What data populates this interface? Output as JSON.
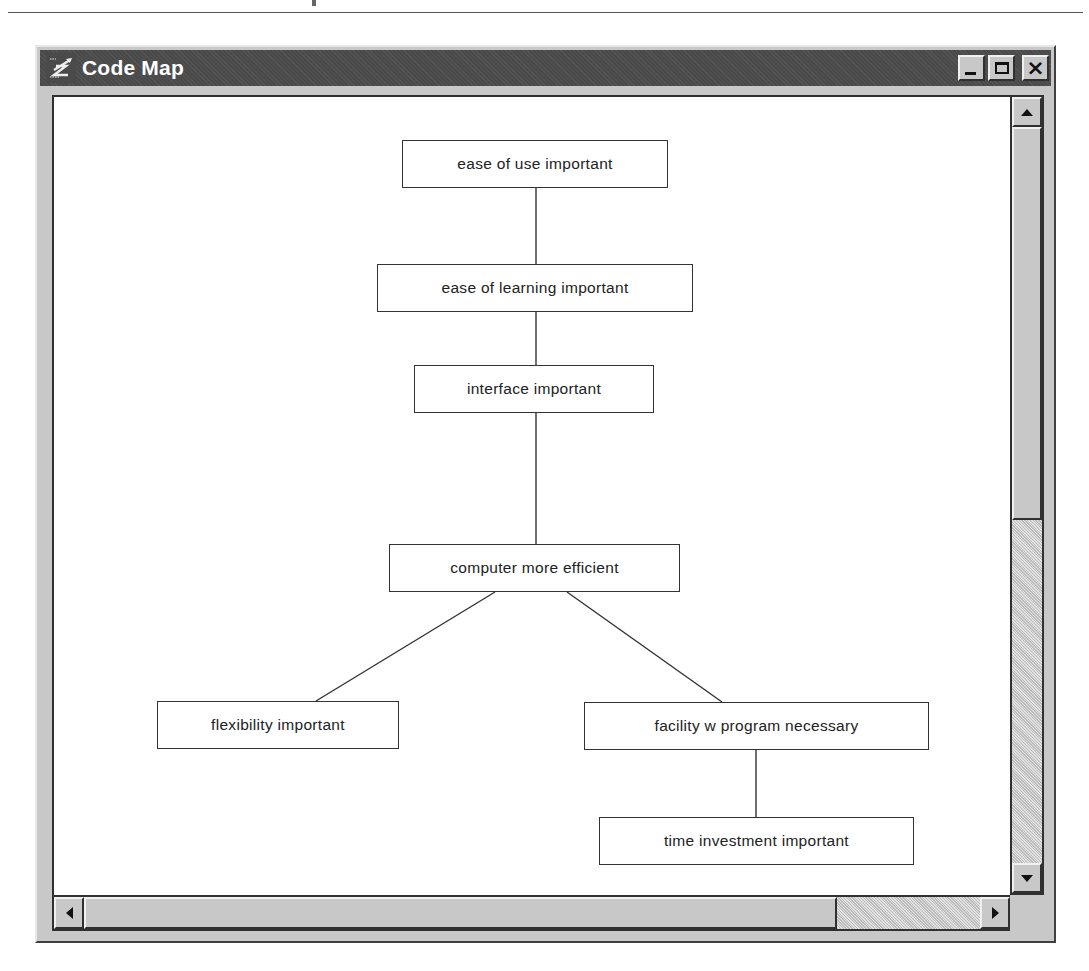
{
  "window": {
    "title": "Code Map",
    "icon": "code-map-app-icon",
    "controls": {
      "minimize": "minimize-icon",
      "maximize": "maximize-icon",
      "close": "close-icon",
      "close_glyph": "×"
    }
  },
  "map": {
    "nodes": [
      {
        "id": "n1",
        "label": "ease of use important",
        "x": 348,
        "y": 43,
        "w": 266,
        "h": 48
      },
      {
        "id": "n2",
        "label": "ease of learning important",
        "x": 323,
        "y": 167,
        "w": 316,
        "h": 48
      },
      {
        "id": "n3",
        "label": "interface important",
        "x": 360,
        "y": 268,
        "w": 240,
        "h": 48
      },
      {
        "id": "n4",
        "label": "computer more efficient",
        "x": 335,
        "y": 447,
        "w": 291,
        "h": 48
      },
      {
        "id": "n5",
        "label": "flexibility important",
        "x": 103,
        "y": 604,
        "w": 242,
        "h": 48
      },
      {
        "id": "n6",
        "label": "facility w program necessary",
        "x": 530,
        "y": 605,
        "w": 345,
        "h": 48
      },
      {
        "id": "n7",
        "label": "time investment important",
        "x": 545,
        "y": 720,
        "w": 315,
        "h": 48
      }
    ],
    "edges": [
      {
        "from": "ease of use important",
        "to": "ease of learning important",
        "x1": 482,
        "y1": 91,
        "x2": 482,
        "y2": 167
      },
      {
        "from": "ease of learning important",
        "to": "interface important",
        "x1": 482,
        "y1": 215,
        "x2": 482,
        "y2": 268
      },
      {
        "from": "interface important",
        "to": "computer more efficient",
        "x1": 482,
        "y1": 316,
        "x2": 482,
        "y2": 447
      },
      {
        "from": "computer more efficient",
        "to": "flexibility important",
        "x1": 441,
        "y1": 495,
        "x2": 262,
        "y2": 604
      },
      {
        "from": "computer more efficient",
        "to": "facility w program necessary",
        "x1": 513,
        "y1": 495,
        "x2": 668,
        "y2": 605
      },
      {
        "from": "facility w program necessary",
        "to": "time investment important",
        "x1": 702,
        "y1": 653,
        "x2": 702,
        "y2": 720
      }
    ]
  },
  "scrollbars": {
    "vertical": {
      "up_icon": "scroll-up-arrow-icon",
      "down_icon": "scroll-down-arrow-icon",
      "thumb_top": 30,
      "thumb_height": 393
    },
    "horizontal": {
      "left_icon": "scroll-left-arrow-icon",
      "right_icon": "scroll-right-arrow-icon",
      "thumb_left": 30,
      "thumb_width": 753
    }
  },
  "colors": {
    "titlebar": "#4a4a4a",
    "chrome": "#c8c8c8",
    "canvas": "#ffffff",
    "node_border": "#333333",
    "edge": "#333333"
  }
}
